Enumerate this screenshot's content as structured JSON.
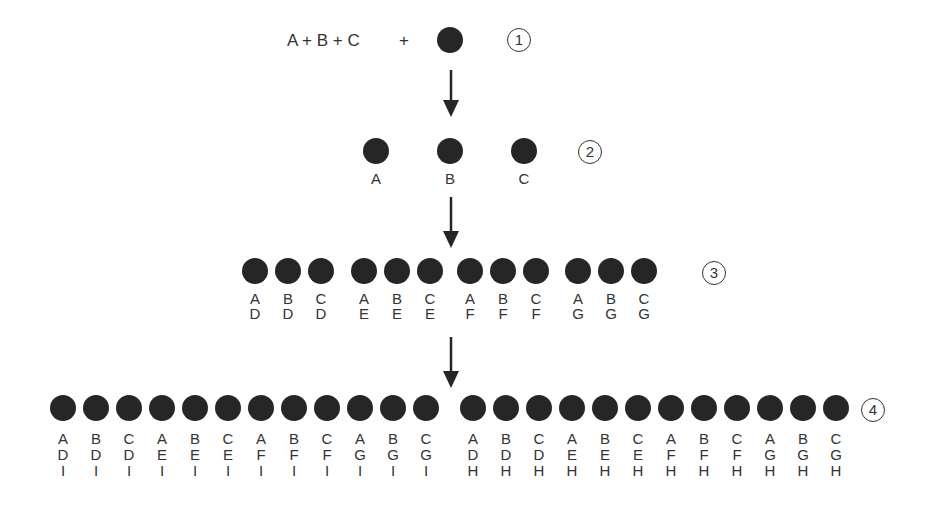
{
  "level1": {
    "formula": "A + B + C",
    "plus": "+",
    "step": "1"
  },
  "level2": {
    "step": "2",
    "items": [
      {
        "label": "A"
      },
      {
        "label": "B"
      },
      {
        "label": "C"
      }
    ]
  },
  "level3": {
    "step": "3",
    "groups": [
      [
        {
          "l1": "A",
          "l2": "D"
        },
        {
          "l1": "B",
          "l2": "D"
        },
        {
          "l1": "C",
          "l2": "D"
        }
      ],
      [
        {
          "l1": "A",
          "l2": "E"
        },
        {
          "l1": "B",
          "l2": "E"
        },
        {
          "l1": "C",
          "l2": "E"
        }
      ],
      [
        {
          "l1": "A",
          "l2": "F"
        },
        {
          "l1": "B",
          "l2": "F"
        },
        {
          "l1": "C",
          "l2": "F"
        }
      ],
      [
        {
          "l1": "A",
          "l2": "G"
        },
        {
          "l1": "B",
          "l2": "G"
        },
        {
          "l1": "C",
          "l2": "G"
        }
      ]
    ]
  },
  "level4": {
    "step": "4",
    "left": [
      {
        "l1": "A",
        "l2": "D",
        "l3": "I"
      },
      {
        "l1": "B",
        "l2": "D",
        "l3": "I"
      },
      {
        "l1": "C",
        "l2": "D",
        "l3": "I"
      },
      {
        "l1": "A",
        "l2": "E",
        "l3": "I"
      },
      {
        "l1": "B",
        "l2": "E",
        "l3": "I"
      },
      {
        "l1": "C",
        "l2": "E",
        "l3": "I"
      },
      {
        "l1": "A",
        "l2": "F",
        "l3": "I"
      },
      {
        "l1": "B",
        "l2": "F",
        "l3": "I"
      },
      {
        "l1": "C",
        "l2": "F",
        "l3": "I"
      },
      {
        "l1": "A",
        "l2": "G",
        "l3": "I"
      },
      {
        "l1": "B",
        "l2": "G",
        "l3": "I"
      },
      {
        "l1": "C",
        "l2": "G",
        "l3": "I"
      }
    ],
    "right": [
      {
        "l1": "A",
        "l2": "D",
        "l3": "H"
      },
      {
        "l1": "B",
        "l2": "D",
        "l3": "H"
      },
      {
        "l1": "C",
        "l2": "D",
        "l3": "H"
      },
      {
        "l1": "A",
        "l2": "E",
        "l3": "H"
      },
      {
        "l1": "B",
        "l2": "E",
        "l3": "H"
      },
      {
        "l1": "C",
        "l2": "E",
        "l3": "H"
      },
      {
        "l1": "A",
        "l2": "F",
        "l3": "H"
      },
      {
        "l1": "B",
        "l2": "F",
        "l3": "H"
      },
      {
        "l1": "C",
        "l2": "F",
        "l3": "H"
      },
      {
        "l1": "A",
        "l2": "G",
        "l3": "H"
      },
      {
        "l1": "B",
        "l2": "G",
        "l3": "H"
      },
      {
        "l1": "C",
        "l2": "G",
        "l3": "H"
      }
    ]
  },
  "colors": {
    "dot": "#262626",
    "text": "#333333",
    "background": "#ffffff"
  }
}
